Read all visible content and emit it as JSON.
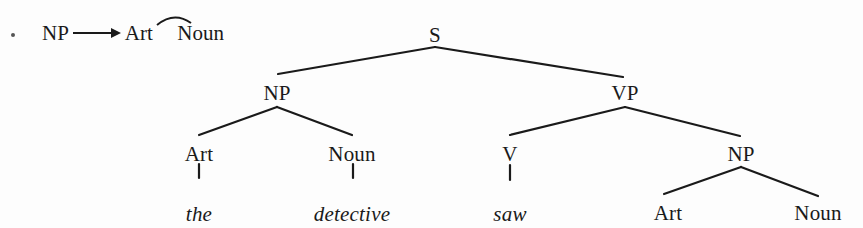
{
  "rule": {
    "bullet": "•",
    "lhs": "NP",
    "arrow": "→",
    "rhs_1": "Art",
    "concat_symbol": "⌒",
    "rhs_2": "Noun"
  },
  "tree": {
    "nodes": {
      "s": {
        "label": "S",
        "x": 435,
        "y": 35
      },
      "np": {
        "label": "NP",
        "x": 277,
        "y": 93
      },
      "vp": {
        "label": "VP",
        "x": 625,
        "y": 93
      },
      "np_art": {
        "label": "Art",
        "x": 199,
        "y": 154
      },
      "np_noun": {
        "label": "Noun",
        "x": 352,
        "y": 154
      },
      "vp_v": {
        "label": "V",
        "x": 510,
        "y": 154
      },
      "vp_np": {
        "label": "NP",
        "x": 741,
        "y": 154
      },
      "vp_np_art": {
        "label": "Art",
        "x": 668,
        "y": 213
      },
      "vp_np_noun": {
        "label": "Noun",
        "x": 818,
        "y": 213
      }
    },
    "words": {
      "the": {
        "label": "the",
        "x": 199,
        "y": 214
      },
      "detective": {
        "label": "detective",
        "x": 352,
        "y": 214
      },
      "saw": {
        "label": "saw",
        "x": 510,
        "y": 214
      }
    }
  },
  "colors": {
    "ink": "#1a1a1a",
    "background": "#fdfdfd"
  }
}
